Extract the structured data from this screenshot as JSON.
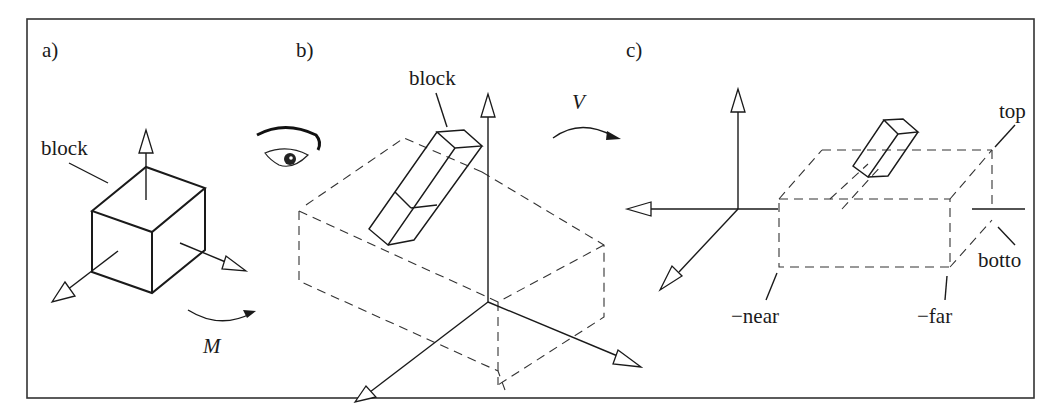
{
  "figure": {
    "panels": [
      {
        "id": "a",
        "label": "a)",
        "block_label": "block",
        "transform_label": "M"
      },
      {
        "id": "b",
        "label": "b)",
        "block_label": "block",
        "transform_label": "V"
      },
      {
        "id": "c",
        "label": "c)",
        "annotations": {
          "top": "top",
          "bottom": "botto",
          "near": "−near",
          "far": "−far"
        }
      }
    ],
    "colors": {
      "ink": "#1a1a1a",
      "background": "#ffffff",
      "frame": "#333333"
    }
  }
}
